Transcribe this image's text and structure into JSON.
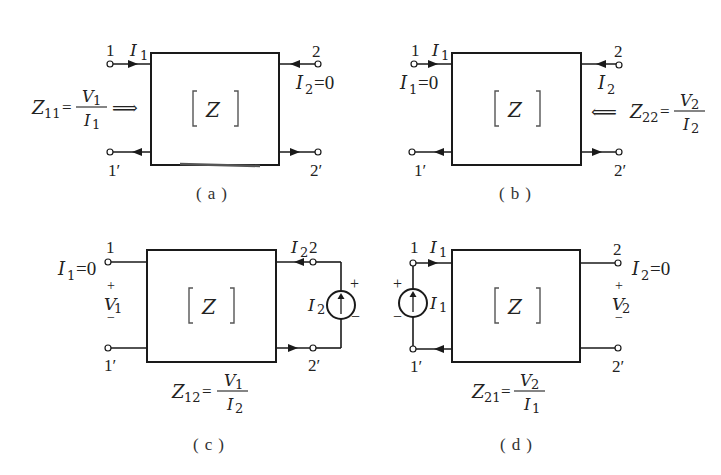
{
  "figure": {
    "box_label": "[Z]",
    "box_letter": "Z",
    "panels": [
      {
        "id": "a",
        "caption": "(a)",
        "terminals": {
          "p1": "1",
          "p1p": "1′",
          "p2": "2",
          "p2p": "2′"
        },
        "current_label": "I",
        "current_sub": "1",
        "condition": {
          "var": "I",
          "sub": "2",
          "eq": "=0"
        },
        "formula": {
          "lhs": "Z",
          "lhs_sub": "11",
          "num": "V",
          "num_sub": "1",
          "den": "I",
          "den_sub": "1",
          "arrow": "⟹"
        }
      },
      {
        "id": "b",
        "caption": "(b)",
        "terminals": {
          "p1": "1",
          "p1p": "1′",
          "p2": "2",
          "p2p": "2′"
        },
        "current_label": "I",
        "current_sub": "1",
        "current2_label": "I",
        "current2_sub": "2",
        "condition": {
          "var": "I",
          "sub": "1",
          "eq": "=0"
        },
        "formula": {
          "lhs": "Z",
          "lhs_sub": "22",
          "num": "V",
          "num_sub": "2",
          "den": "I",
          "den_sub": "2",
          "arrow": "⟸"
        }
      },
      {
        "id": "c",
        "caption": "(c)",
        "terminals": {
          "p1": "1",
          "p1p": "1′",
          "p2": "2",
          "p2p": "2′"
        },
        "current_label": "I",
        "current_sub": "2",
        "source_label": "I",
        "source_sub": "2",
        "source_plus": "+",
        "source_minus": "−",
        "voltage": {
          "plus": "+",
          "var": "V",
          "sub": "1",
          "minus": "−"
        },
        "condition": {
          "var": "I",
          "sub": "1",
          "eq": "=0"
        },
        "formula": {
          "lhs": "Z",
          "lhs_sub": "12",
          "num": "V",
          "num_sub": "1",
          "den": "I",
          "den_sub": "2"
        }
      },
      {
        "id": "d",
        "caption": "(d)",
        "terminals": {
          "p1": "1",
          "p1p": "1′",
          "p2": "2",
          "p2p": "2′"
        },
        "current_label": "I",
        "current_sub": "1",
        "source_label": "I",
        "source_sub": "1",
        "source_plus": "+",
        "source_minus": "−",
        "voltage": {
          "plus": "+",
          "var": "V",
          "sub": "2",
          "minus": "−"
        },
        "condition": {
          "var": "I",
          "sub": "2",
          "eq": "=0"
        },
        "formula": {
          "lhs": "Z",
          "lhs_sub": "21",
          "num": "V",
          "num_sub": "2",
          "den": "I",
          "den_sub": "1"
        }
      }
    ]
  }
}
